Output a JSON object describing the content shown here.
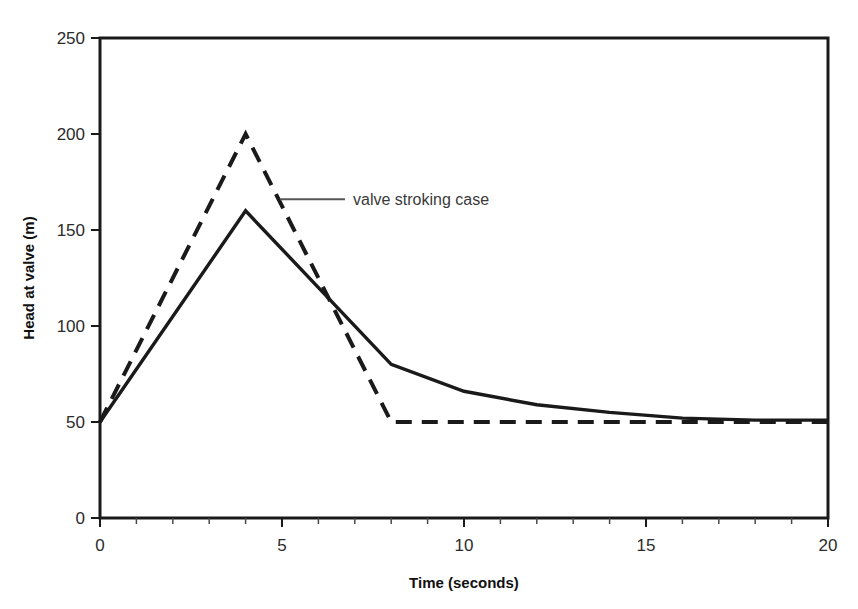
{
  "chart_data": {
    "type": "line",
    "title": "",
    "subtitle": "",
    "xlabel": "Time (seconds)",
    "ylabel": "Head at valve (m)",
    "xlim": [
      0,
      20
    ],
    "ylim": [
      0,
      250
    ],
    "xticks": [
      0,
      5,
      10,
      15,
      20
    ],
    "yticks": [
      0,
      50,
      100,
      150,
      200,
      250
    ],
    "xtick_labels": [
      "0",
      "5",
      "10",
      "15",
      "20"
    ],
    "ytick_labels": [
      "0",
      "50",
      "100",
      "150",
      "200",
      "250"
    ],
    "x_minor_tick_step": 1,
    "grid": false,
    "legend": "none",
    "frame": "box",
    "annotations": [
      {
        "text": "valve stroking case",
        "x": 5.0,
        "y": 166,
        "leader_from_x": 4.95,
        "leader_from_y": 166,
        "leader_to_x": 6.73,
        "leader_to_y": 166
      }
    ],
    "series": [
      {
        "name": "rapid valve closure case",
        "style": "dashed",
        "color": "#1a1a1a",
        "x": [
          0,
          4,
          8,
          9,
          10,
          12,
          14,
          16,
          18,
          20
        ],
        "values": [
          50,
          200,
          50,
          50,
          50,
          50,
          50,
          50,
          50,
          50
        ]
      },
      {
        "name": "valve stroking case",
        "style": "solid",
        "color": "#1a1a1a",
        "x": [
          0,
          4,
          8,
          10,
          12,
          14,
          16,
          18,
          20
        ],
        "values": [
          50,
          160,
          80,
          66,
          59,
          55,
          52,
          51,
          51
        ]
      }
    ]
  },
  "axes": {
    "x_title": "Time (seconds)",
    "y_title": "Head at valve (m)"
  }
}
